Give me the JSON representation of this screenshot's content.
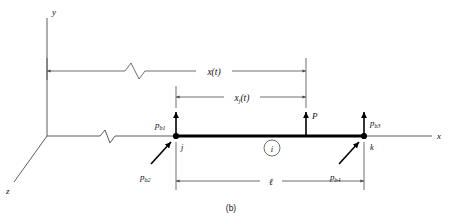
{
  "figure": {
    "caption": "(b)",
    "axes": {
      "y_label": "y",
      "x_label": "x",
      "z_label": "z"
    },
    "dimensions": [
      {
        "name": "global-position",
        "label": "x(t)",
        "has_break": true
      },
      {
        "name": "element-local-position",
        "label": "x",
        "subscript": "j",
        "suffix": "(t)",
        "has_break": false
      },
      {
        "name": "element-length",
        "label": "ℓ",
        "has_break": false
      }
    ],
    "nodes": [
      {
        "name": "node-j",
        "label": "j"
      },
      {
        "name": "node-k",
        "label": "k"
      }
    ],
    "element": {
      "label": "i",
      "circled": true
    },
    "loads": [
      {
        "name": "applied-load",
        "label": "P",
        "direction": "up"
      },
      {
        "name": "nodal-force-1",
        "label": "p",
        "subscript": "b1",
        "direction": "up",
        "at": "node-j"
      },
      {
        "name": "nodal-force-2",
        "label": "p",
        "subscript": "b2",
        "direction": "diagonal-up-right",
        "at": "node-j"
      },
      {
        "name": "nodal-force-3",
        "label": "p",
        "subscript": "b3",
        "direction": "up",
        "at": "node-k"
      },
      {
        "name": "nodal-force-4",
        "label": "p",
        "subscript": "b4",
        "direction": "diagonal-up-right",
        "at": "node-k"
      }
    ]
  },
  "colors": {
    "line": "#4a4a4a",
    "beam": "#000000",
    "text": "#101010",
    "background": "#ffffff"
  }
}
